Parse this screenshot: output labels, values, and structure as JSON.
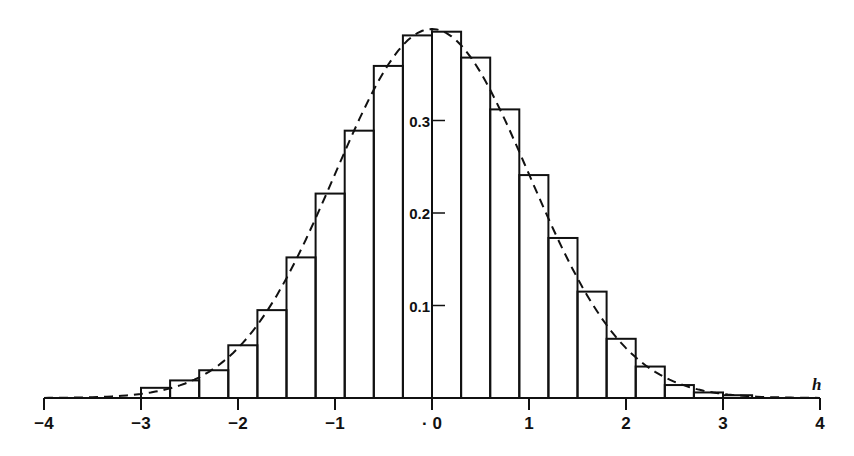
{
  "chart_data": {
    "type": "bar",
    "title": "",
    "xlabel": "h",
    "ylabel": "",
    "xlim": [
      -4,
      4
    ],
    "ylim": [
      0,
      0.4
    ],
    "grid": false,
    "legend": null,
    "x_ticks": [
      "-4",
      "-3",
      "-2",
      "-1",
      "· 0",
      "1",
      "2",
      "3",
      "4"
    ],
    "x_tick_values": [
      -4,
      -3,
      -2,
      -1,
      0,
      1,
      2,
      3,
      4
    ],
    "y_ticks": [
      "0.1",
      "0.2",
      "0.3"
    ],
    "y_tick_values": [
      0.1,
      0.2,
      0.3
    ],
    "bin_width": 0.3,
    "bin_edges": [
      -3.0,
      -2.7,
      -2.4,
      -2.1,
      -1.8,
      -1.5,
      -1.2,
      -0.9,
      -0.6,
      -0.3,
      0.0,
      0.3,
      0.6,
      0.9,
      1.2,
      1.5,
      1.8,
      2.1,
      2.4,
      2.7,
      3.0,
      3.3
    ],
    "categories": [
      "-3.0–-2.7",
      "-2.7–-2.4",
      "-2.4–-2.1",
      "-2.1–-1.8",
      "-1.8–-1.5",
      "-1.5–-1.2",
      "-1.2–-0.9",
      "-0.9–-0.6",
      "-0.6–-0.3",
      "-0.3–0.0",
      "0.0–0.3",
      "0.3–0.6",
      "0.6–0.9",
      "0.9–1.2",
      "1.2–1.5",
      "1.5–1.8",
      "1.8–2.1",
      "2.1–2.4",
      "2.4–2.7",
      "2.7–3.0",
      "3.0–3.3"
    ],
    "series": [
      {
        "name": "histogram",
        "style": "outlined bars",
        "values": [
          0.011,
          0.019,
          0.03,
          0.057,
          0.095,
          0.152,
          0.221,
          0.289,
          0.359,
          0.392,
          0.396,
          0.368,
          0.312,
          0.241,
          0.173,
          0.115,
          0.064,
          0.034,
          0.014,
          0.006,
          0.003
        ]
      },
      {
        "name": "normal density curve",
        "style": "dashed line",
        "function": "standard normal pdf",
        "peak": 0.399
      }
    ],
    "annotations": []
  },
  "colors": {
    "ink": "#111111",
    "background": "#ffffff"
  }
}
